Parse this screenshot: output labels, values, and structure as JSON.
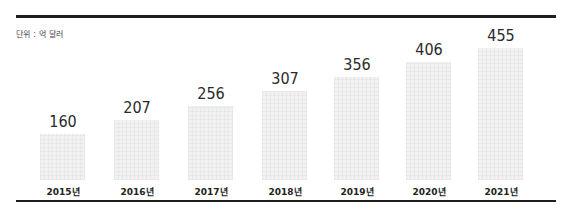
{
  "unit_label": "단위 : 억 달러",
  "chart_data": {
    "type": "bar",
    "title": "",
    "unit": "억 달러",
    "xlabel": "",
    "ylabel": "",
    "categories": [
      "2015년",
      "2016년",
      "2017년",
      "2018년",
      "2019년",
      "2020년",
      "2021년"
    ],
    "values": [
      160,
      207,
      256,
      307,
      356,
      406,
      455
    ],
    "ylim": [
      0,
      455
    ],
    "grid": false,
    "legend": null,
    "bar_color": "#f1f1f1"
  },
  "labels": {
    "v0": "160",
    "v1": "207",
    "v2": "256",
    "v3": "307",
    "v4": "356",
    "v5": "406",
    "v6": "455",
    "c0": "2015년",
    "c1": "2016년",
    "c2": "2017년",
    "c3": "2018년",
    "c4": "2019년",
    "c5": "2020년",
    "c6": "2021년"
  }
}
